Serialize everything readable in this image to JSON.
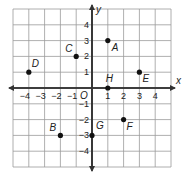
{
  "figure": {
    "type": "coordinate-plane",
    "x_axis_label": "x",
    "y_axis_label": "y",
    "origin_label": "O",
    "range": {
      "xmin": -5,
      "xmax": 5,
      "ymin": -5,
      "ymax": 5
    },
    "x_ticks": [
      {
        "value": -4,
        "label": "−4"
      },
      {
        "value": -3,
        "label": "−3"
      },
      {
        "value": -2,
        "label": "−2"
      },
      {
        "value": -1,
        "label": "−1"
      },
      {
        "value": 1,
        "label": "1"
      },
      {
        "value": 2,
        "label": "2"
      },
      {
        "value": 3,
        "label": "3"
      },
      {
        "value": 4,
        "label": "4"
      }
    ],
    "y_ticks": [
      {
        "value": 4,
        "label": "4"
      },
      {
        "value": 3,
        "label": "3"
      },
      {
        "value": 2,
        "label": "2"
      },
      {
        "value": 1,
        "label": "1"
      },
      {
        "value": -1,
        "label": "−1"
      },
      {
        "value": -2,
        "label": "−2"
      },
      {
        "value": -3,
        "label": "−3"
      },
      {
        "value": -4,
        "label": "−4"
      }
    ],
    "points": [
      {
        "name": "A",
        "x": 1,
        "y": 3,
        "label_dx": 4,
        "label_dy": 10
      },
      {
        "name": "B",
        "x": -2,
        "y": -3,
        "label_dx": -11,
        "label_dy": -4
      },
      {
        "name": "C",
        "x": -1,
        "y": 2,
        "label_dx": -11,
        "label_dy": -4
      },
      {
        "name": "D",
        "x": -4,
        "y": 1,
        "label_dx": 3,
        "label_dy": -5
      },
      {
        "name": "E",
        "x": 3,
        "y": 1,
        "label_dx": 3,
        "label_dy": 10
      },
      {
        "name": "F",
        "x": 2,
        "y": -2,
        "label_dx": 3,
        "label_dy": 10
      },
      {
        "name": "G",
        "x": 0,
        "y": -3,
        "label_dx": 4,
        "label_dy": -6
      },
      {
        "name": "H",
        "x": 1,
        "y": 0,
        "label_dx": -2,
        "label_dy": -6
      }
    ],
    "colors": {
      "grid": "#9a9a9a",
      "axis": "#333333",
      "point": "#111111",
      "text": "#222222"
    }
  }
}
